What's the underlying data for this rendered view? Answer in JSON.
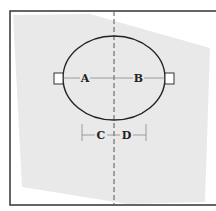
{
  "diagram": {
    "labels": {
      "a": "A",
      "b": "B",
      "c": "C",
      "d": "D"
    },
    "colors": {
      "frame": "#333333",
      "fill": "#e9e9e9",
      "stroke": "#222222",
      "dimension": "#777777"
    }
  }
}
